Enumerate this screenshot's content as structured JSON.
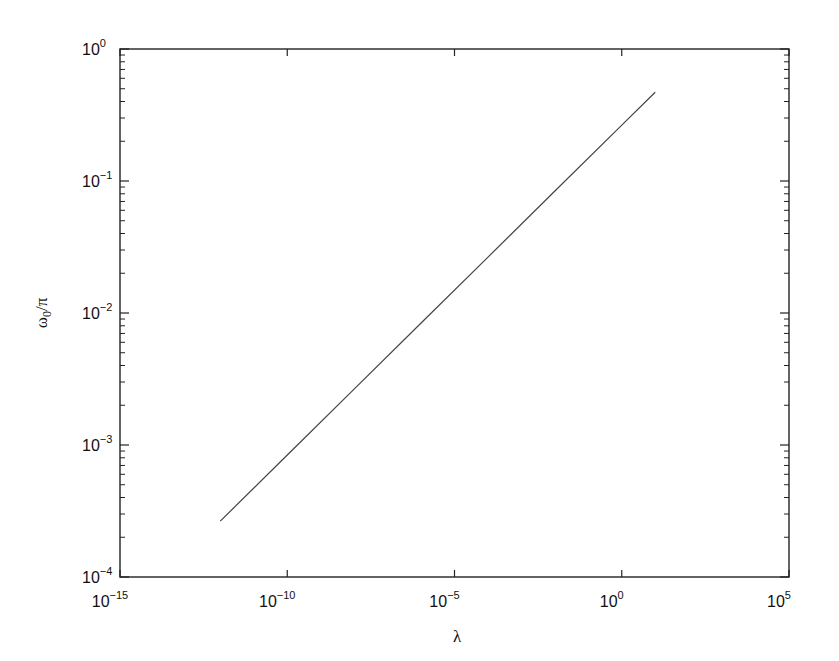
{
  "chart_data": {
    "type": "line",
    "title": "",
    "xlabel": "λ",
    "ylabel": "ω0/π",
    "ylabel_parts": {
      "base": "ω",
      "sub": "0",
      "rest": "/π"
    },
    "xscale": "log",
    "yscale": "log",
    "xlim": [
      1e-15,
      100000.0
    ],
    "ylim": [
      0.0001,
      1.0
    ],
    "grid": false,
    "legend": null,
    "x_ticks": [
      {
        "base": "10",
        "exp": "−15",
        "value": -15
      },
      {
        "base": "10",
        "exp": "−10",
        "value": -10
      },
      {
        "base": "10",
        "exp": "−5",
        "value": -5
      },
      {
        "base": "10",
        "exp": "0",
        "value": 0
      },
      {
        "base": "10",
        "exp": "5",
        "value": 5
      }
    ],
    "y_ticks": [
      {
        "base": "10",
        "exp": "0",
        "value": 0
      },
      {
        "base": "10",
        "exp": "−1",
        "value": -1
      },
      {
        "base": "10",
        "exp": "−2",
        "value": -2
      },
      {
        "base": "10",
        "exp": "−3",
        "value": -3
      },
      {
        "base": "10",
        "exp": "−4",
        "value": -4
      }
    ],
    "series": [
      {
        "name": "ω0/π vs λ",
        "color": "#444444",
        "x": [
          1e-12,
          1e-10,
          1e-08,
          1e-06,
          0.0001,
          0.01,
          1.0,
          10.0
        ],
        "y": [
          0.000265,
          0.00084,
          0.00265,
          0.0084,
          0.0265,
          0.084,
          0.265,
          0.47
        ]
      }
    ]
  }
}
